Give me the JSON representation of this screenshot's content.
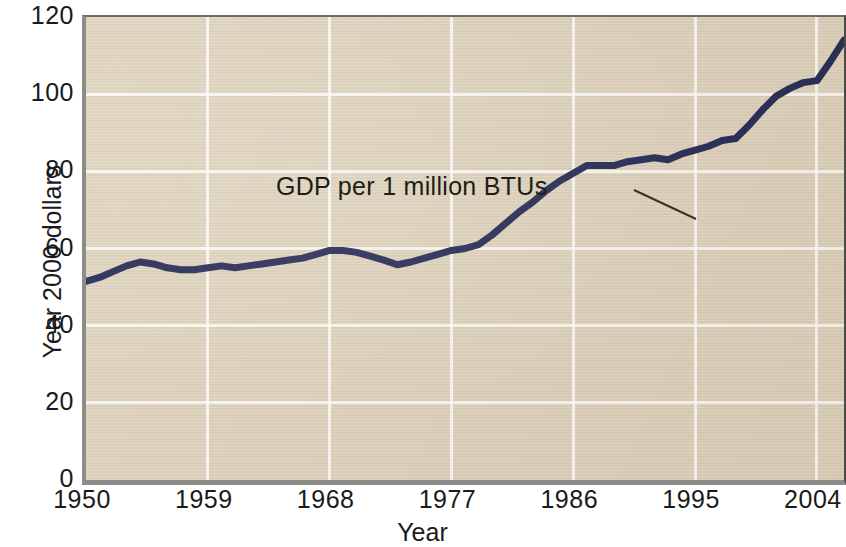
{
  "chart_data": {
    "type": "line",
    "title": "",
    "xlabel": "Year",
    "ylabel": "Year 2000 dollars",
    "xlim": [
      1950,
      2006
    ],
    "ylim": [
      0,
      120
    ],
    "grid": true,
    "legend_position": "none",
    "xticks": [
      "1950",
      "1959",
      "1968",
      "1977",
      "1986",
      "1995",
      "2004"
    ],
    "xtick_values": [
      1950,
      1959,
      1968,
      1977,
      1986,
      1995,
      2004
    ],
    "yticks": [
      "0",
      "20",
      "40",
      "60",
      "80",
      "100",
      "120"
    ],
    "ytick_values": [
      0,
      20,
      40,
      60,
      80,
      100,
      120
    ],
    "annotations": [
      {
        "text": "GDP per 1 million BTUs",
        "points_to_series": "GDP per 1 million BTUs"
      }
    ],
    "series": [
      {
        "name": "GDP per 1 million BTUs",
        "color": "#1e2350",
        "line_width": 7,
        "x": [
          1950,
          1951,
          1952,
          1953,
          1954,
          1955,
          1956,
          1957,
          1958,
          1959,
          1960,
          1961,
          1962,
          1963,
          1964,
          1965,
          1966,
          1967,
          1968,
          1969,
          1970,
          1971,
          1972,
          1973,
          1974,
          1975,
          1976,
          1977,
          1978,
          1979,
          1980,
          1981,
          1982,
          1983,
          1984,
          1985,
          1986,
          1987,
          1988,
          1989,
          1990,
          1991,
          1992,
          1993,
          1994,
          1995,
          1996,
          1997,
          1998,
          1999,
          2000,
          2001,
          2002,
          2003,
          2004,
          2005,
          2006
        ],
        "values": [
          51.5,
          52.5,
          54.0,
          55.5,
          56.5,
          56.0,
          55.0,
          54.5,
          54.5,
          55.0,
          55.5,
          55.0,
          55.5,
          56.0,
          56.5,
          57.0,
          57.5,
          58.5,
          59.5,
          59.5,
          59.0,
          58.0,
          57.0,
          55.8,
          56.5,
          57.5,
          58.5,
          59.5,
          60.0,
          61.0,
          63.5,
          66.5,
          69.5,
          72.0,
          75.0,
          77.5,
          79.5,
          81.5,
          81.5,
          81.5,
          82.5,
          83.0,
          83.5,
          83.0,
          84.5,
          85.5,
          86.5,
          88.0,
          88.5,
          92.0,
          96.0,
          99.5,
          101.5,
          103.0,
          103.5,
          108.5,
          114.0
        ]
      }
    ]
  },
  "axes": {
    "y_axis_label": "Year 2000 dollars",
    "x_axis_label": "Year"
  },
  "style": {
    "plot_background": "#ddd1ba",
    "gridline_color": "#ffffff",
    "line_color": "#1e2350",
    "text_color": "#1a1a1a",
    "page_background": "#ffffff"
  }
}
